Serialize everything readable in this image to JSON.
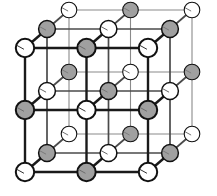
{
  "figure": {
    "name": "rock-salt-crystal-lattice",
    "title": "",
    "caption": "",
    "width": 217,
    "height": 196,
    "background": "#ffffff"
  },
  "projection": {
    "type": "oblique",
    "origin_x": 25,
    "origin_y": 172,
    "step_x": 61.5,
    "step_y": -62.0,
    "depth_dx": 22.0,
    "depth_dy": -19.0,
    "grid_size": 3
  },
  "style": {
    "atom_a_fill": "#ffffff",
    "atom_b_fill": "#a0a0a0",
    "atom_stroke": "#111111",
    "bond_color_front": "#1a1a1a",
    "bond_color_mid": "#4a4a4a",
    "bond_color_back": "#8a8a8a",
    "radius_front": 9.2,
    "radius_mid": 8.4,
    "radius_back": 7.8,
    "atom_stroke_front": 2.0,
    "atom_stroke_mid": 1.5,
    "atom_stroke_back": 1.1,
    "bond_width_front": 2.4,
    "bond_width_mid": 1.7,
    "bond_width_back": 1.1,
    "highlight_color": "#ffffff",
    "shade_color": "#6e6e6e"
  },
  "legend": {
    "atom_a_label": "",
    "atom_b_label": ""
  },
  "chart_data": {
    "type": "scatter",
    "xlabel": "",
    "ylabel": "",
    "note": "Atoms alternate between species A (open/white) and species B (shaded/grey) on a simple cubic grid; parity of (i+j+k) selects the species.",
    "species": [
      {
        "name": "A",
        "marker": "open-circle",
        "fill": "#ffffff",
        "parity": 0
      },
      {
        "name": "B",
        "marker": "shaded-circle",
        "fill": "#a0a0a0",
        "parity": 1
      }
    ],
    "lattice_indices": [
      0,
      1,
      2
    ],
    "bond_axes": [
      "i",
      "j",
      "k"
    ],
    "counts": {
      "atoms_total": 27,
      "atoms_A": 14,
      "atoms_B": 13,
      "bonds_total": 54
    }
  }
}
